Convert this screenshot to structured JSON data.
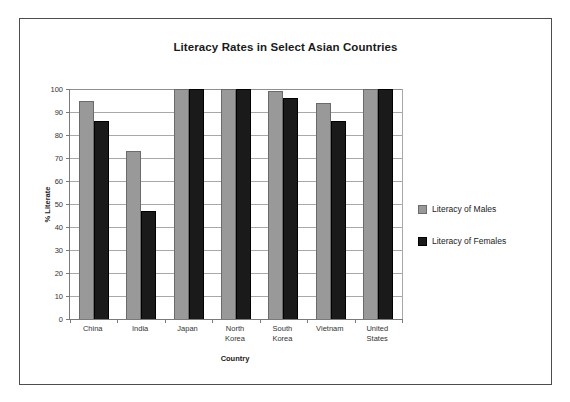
{
  "chart_data": {
    "type": "bar",
    "title": "Literacy Rates in Select Asian Countries",
    "xlabel": "Country",
    "ylabel": "% Literate",
    "ylim": [
      0,
      100
    ],
    "ytick_step": 10,
    "yticks": [
      100,
      90,
      80,
      70,
      60,
      50,
      40,
      30,
      20,
      10,
      0
    ],
    "grid": true,
    "legend_position": "right",
    "categories": [
      "China",
      "India",
      "Japan",
      "North Korea",
      "South Korea",
      "Vietnam",
      "United States"
    ],
    "category_lines": [
      [
        "China"
      ],
      [
        "India"
      ],
      [
        "Japan"
      ],
      [
        "North",
        "Korea"
      ],
      [
        "South",
        "Korea"
      ],
      [
        "Vietnam"
      ],
      [
        "United",
        "States"
      ]
    ],
    "series": [
      {
        "name": "Literacy of Males",
        "color": "#999999",
        "values": [
          95,
          73,
          100,
          100,
          99,
          94,
          100
        ]
      },
      {
        "name": "Literacy of Females",
        "color": "#1a1a1a",
        "values": [
          86,
          47,
          100,
          100,
          96,
          86,
          100
        ]
      }
    ]
  }
}
